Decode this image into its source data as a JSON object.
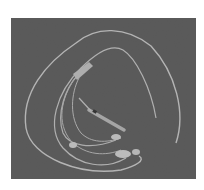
{
  "image": {
    "subject": "medical catheter tubing set coiled on gray background",
    "background_color": "#ffffff",
    "photo_background": "#5a5a5a",
    "tube_color": "#e8e8e8"
  }
}
